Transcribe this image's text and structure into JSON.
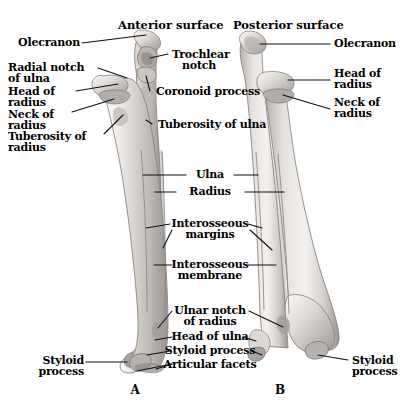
{
  "figure": {
    "background_color": "#ffffff",
    "text_color": "#000000",
    "leader_line_color": "#1a1a1a"
  },
  "headings": {
    "anterior": "Anterior surface",
    "posterior": "Posterior surface"
  },
  "panels": {
    "a_letter": "A",
    "b_letter": "B"
  },
  "labels_left_panel": [
    {
      "id": "olecranon",
      "text": "Olecranon"
    },
    {
      "id": "radial-notch-of-ulna",
      "line1": "Radial notch",
      "line2": "of ulna"
    },
    {
      "id": "head-of-radius",
      "line1": "Head of",
      "line2": "radius"
    },
    {
      "id": "neck-of-radius",
      "line1": "Neck of",
      "line2": "radius"
    },
    {
      "id": "tuberosity-of-radius",
      "line1": "Tuberosity of",
      "line2": "radius"
    },
    {
      "id": "trochlear-notch",
      "line1": "Trochlear",
      "line2": "notch"
    },
    {
      "id": "coronoid-process",
      "text": "Coronoid process"
    },
    {
      "id": "tuberosity-of-ulna",
      "text": "Tuberosity of ulna"
    },
    {
      "id": "styloid-process-left",
      "line1": "Styloid",
      "line2": "process"
    }
  ],
  "labels_center": [
    {
      "id": "ulna",
      "text": "Ulna"
    },
    {
      "id": "radius",
      "text": "Radius"
    },
    {
      "id": "interosseous-margins",
      "line1": "Interosseous",
      "line2": "margins"
    },
    {
      "id": "interosseous-membrane",
      "line1": "Interosseous",
      "line2": "membrane"
    },
    {
      "id": "ulnar-notch-of-radius",
      "line1": "Ulnar notch",
      "line2": "of radius"
    },
    {
      "id": "head-of-ulna",
      "text": "Head of ulna"
    },
    {
      "id": "styloid-process-center",
      "text": "Styloid process"
    },
    {
      "id": "articular-facets",
      "text": "Articular facets"
    }
  ],
  "labels_right_panel": [
    {
      "id": "olecranon-right",
      "text": "Olecranon"
    },
    {
      "id": "head-of-radius-right",
      "line1": "Head of",
      "line2": "radius"
    },
    {
      "id": "neck-of-radius-right",
      "line1": "Neck of",
      "line2": "radius"
    },
    {
      "id": "styloid-process-right",
      "line1": "Styloid",
      "line2": "process"
    }
  ]
}
